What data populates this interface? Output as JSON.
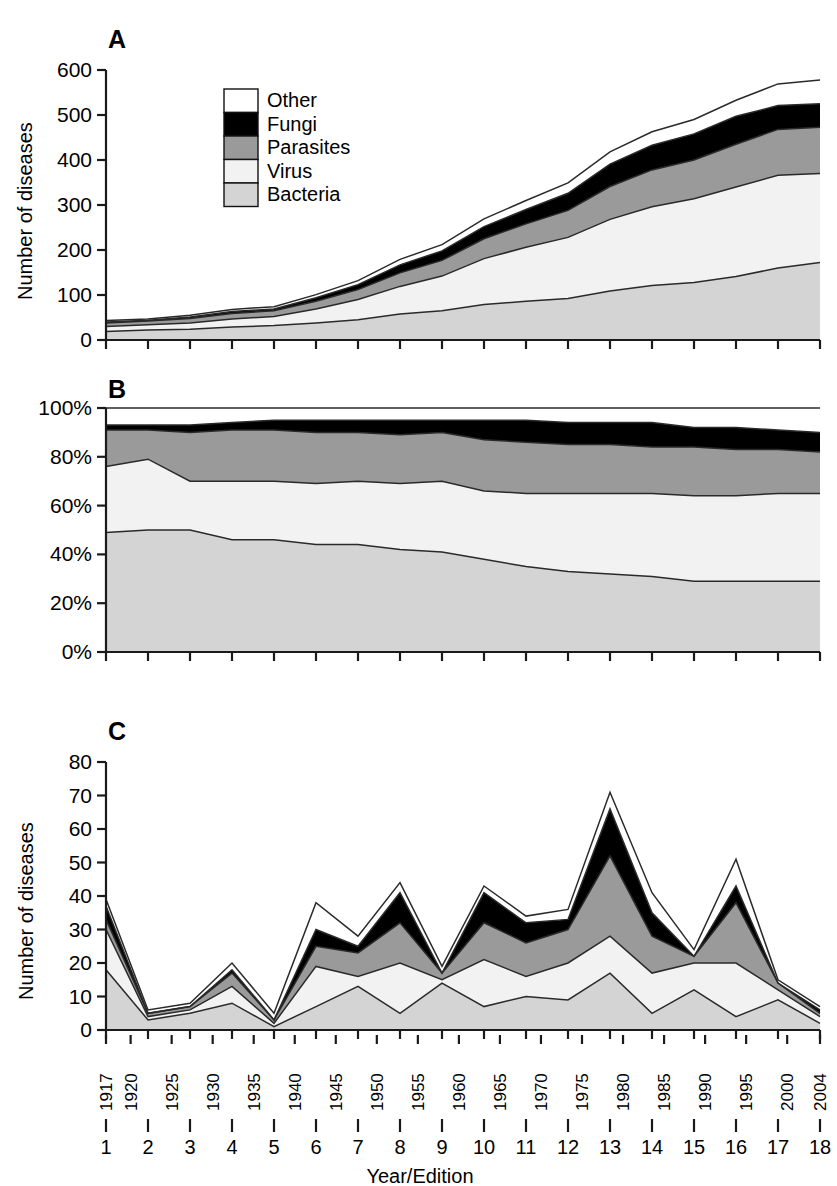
{
  "figure": {
    "panels": [
      {
        "letter": "A",
        "ylabel": "Number of diseases",
        "yticks": [
          "600",
          "500",
          "400",
          "300",
          "200",
          "100",
          "0"
        ]
      },
      {
        "letter": "B",
        "ylabel": "",
        "yticks": [
          "100%",
          "80%",
          "60%",
          "40%",
          "20%",
          "0%"
        ]
      },
      {
        "letter": "C",
        "ylabel": "Number of diseases",
        "yticks": [
          "80",
          "70",
          "60",
          "50",
          "40",
          "30",
          "20",
          "10",
          "0"
        ]
      }
    ],
    "xaxis_title": "Year/Edition",
    "years": [
      "1917",
      "1920",
      "1925",
      "1930",
      "1935",
      "1940",
      "1945",
      "1950",
      "1955",
      "1960",
      "1965",
      "1970",
      "1975",
      "1980",
      "1985",
      "1990",
      "1995",
      "2000",
      "2004"
    ],
    "editions": [
      "1",
      "2",
      "3",
      "4",
      "5",
      "6",
      "7",
      "8",
      "9",
      "10",
      "11",
      "12",
      "13",
      "14",
      "15",
      "16",
      "17",
      "18"
    ],
    "legend": {
      "items": [
        {
          "label": "Other",
          "color": "#ffffff"
        },
        {
          "label": "Fungi",
          "color": "#000000"
        },
        {
          "label": "Parasites",
          "color": "#9a9a9a"
        },
        {
          "label": "Virus",
          "color": "#f2f2f2"
        },
        {
          "label": "Bacteria",
          "color": "#d4d4d4"
        }
      ]
    }
  },
  "chart_data": [
    {
      "type": "area",
      "id": "A",
      "title": "A",
      "xlabel": "Year/Edition",
      "ylabel": "Number of diseases",
      "ylim": [
        0,
        600
      ],
      "yticks": [
        0,
        100,
        200,
        300,
        400,
        500,
        600
      ],
      "grid": false,
      "stacked": true,
      "legend_position": "inside-top-left",
      "categories": [
        "1917",
        "1925",
        "1930",
        "1935",
        "1940",
        "1945",
        "1950",
        "1955",
        "1960",
        "1965",
        "1970",
        "1975",
        "1980",
        "1985",
        "1990",
        "1995",
        "2000",
        "2004"
      ],
      "edition_numbers": [
        1,
        2,
        3,
        4,
        5,
        6,
        7,
        8,
        9,
        10,
        11,
        12,
        13,
        14,
        15,
        16,
        17,
        18
      ],
      "series": [
        {
          "name": "Bacteria",
          "color": "#d4d4d4",
          "values": [
            19,
            22,
            24,
            29,
            32,
            38,
            45,
            58,
            65,
            79,
            86,
            92,
            109,
            121,
            128,
            141,
            160,
            172
          ]
        },
        {
          "name": "Virus",
          "color": "#f2f2f2",
          "values": [
            11,
            12,
            14,
            18,
            20,
            31,
            45,
            61,
            77,
            102,
            120,
            136,
            159,
            175,
            186,
            199,
            206,
            198
          ]
        },
        {
          "name": "Parasites",
          "color": "#9a9a9a",
          "values": [
            8,
            8,
            10,
            12,
            13,
            17,
            22,
            30,
            35,
            44,
            52,
            60,
            73,
            82,
            86,
            95,
            102,
            103
          ]
        },
        {
          "name": "Fungi",
          "color": "#000000",
          "values": [
            2,
            2,
            3,
            4,
            4,
            8,
            11,
            18,
            21,
            27,
            32,
            38,
            50,
            55,
            58,
            62,
            53,
            52
          ]
        },
        {
          "name": "Other",
          "color": "#ffffff",
          "values": [
            3,
            3,
            4,
            5,
            5,
            7,
            9,
            12,
            14,
            17,
            20,
            23,
            27,
            30,
            32,
            36,
            48,
            53
          ]
        }
      ],
      "totals": [
        43,
        47,
        55,
        68,
        74,
        101,
        132,
        179,
        212,
        269,
        310,
        349,
        418,
        463,
        490,
        533,
        569,
        578
      ]
    },
    {
      "type": "area",
      "id": "B",
      "title": "B",
      "xlabel": "Year/Edition",
      "ylabel": "",
      "ylim": [
        0,
        100
      ],
      "yticks": [
        0,
        20,
        40,
        60,
        80,
        100
      ],
      "unit": "%",
      "grid": false,
      "stacked": true,
      "normalized": true,
      "categories": [
        "1917",
        "1925",
        "1930",
        "1935",
        "1940",
        "1945",
        "1950",
        "1955",
        "1960",
        "1965",
        "1970",
        "1975",
        "1980",
        "1985",
        "1990",
        "1995",
        "2000",
        "2004"
      ],
      "edition_numbers": [
        1,
        2,
        3,
        4,
        5,
        6,
        7,
        8,
        9,
        10,
        11,
        12,
        13,
        14,
        15,
        16,
        17,
        18
      ],
      "series": [
        {
          "name": "Bacteria",
          "color": "#d4d4d4",
          "values": [
            49,
            50,
            50,
            46,
            46,
            44,
            44,
            42,
            41,
            38,
            35,
            33,
            32,
            31,
            29,
            29,
            29,
            29
          ]
        },
        {
          "name": "Virus",
          "color": "#f2f2f2",
          "values": [
            27,
            29,
            20,
            24,
            24,
            25,
            26,
            27,
            29,
            28,
            30,
            32,
            33,
            34,
            35,
            35,
            36,
            36
          ]
        },
        {
          "name": "Parasites",
          "color": "#9a9a9a",
          "values": [
            15,
            12,
            20,
            21,
            21,
            21,
            20,
            20,
            20,
            21,
            21,
            20,
            20,
            19,
            20,
            19,
            18,
            17
          ]
        },
        {
          "name": "Fungi",
          "color": "#000000",
          "values": [
            2,
            2,
            3,
            3,
            4,
            5,
            5,
            6,
            5,
            8,
            9,
            9,
            9,
            10,
            8,
            9,
            8,
            8
          ]
        },
        {
          "name": "Other",
          "color": "#ffffff",
          "values": [
            7,
            7,
            7,
            6,
            5,
            5,
            5,
            5,
            5,
            5,
            5,
            6,
            6,
            6,
            8,
            8,
            9,
            10
          ]
        }
      ]
    },
    {
      "type": "area",
      "id": "C",
      "title": "C",
      "xlabel": "Year/Edition",
      "ylabel": "Number of diseases",
      "ylim": [
        0,
        80
      ],
      "yticks": [
        0,
        10,
        20,
        30,
        40,
        50,
        60,
        70,
        80
      ],
      "grid": false,
      "stacked": true,
      "categories": [
        "1917",
        "1925",
        "1930",
        "1935",
        "1940",
        "1945",
        "1950",
        "1955",
        "1960",
        "1965",
        "1970",
        "1975",
        "1980",
        "1985",
        "1990",
        "1995",
        "2000",
        "2004"
      ],
      "edition_numbers": [
        1,
        2,
        3,
        4,
        5,
        6,
        7,
        8,
        9,
        10,
        11,
        12,
        13,
        14,
        15,
        16,
        17,
        18
      ],
      "series": [
        {
          "name": "Bacteria",
          "color": "#d4d4d4",
          "values": [
            18,
            3,
            5,
            8,
            1,
            7,
            13,
            5,
            14,
            7,
            10,
            9,
            17,
            5,
            12,
            4,
            9,
            2
          ]
        },
        {
          "name": "Virus",
          "color": "#f2f2f2",
          "values": [
            12,
            1,
            1,
            5,
            1,
            12,
            3,
            15,
            1,
            14,
            6,
            11,
            11,
            12,
            8,
            16,
            3,
            2
          ]
        },
        {
          "name": "Parasites",
          "color": "#9a9a9a",
          "values": [
            3,
            1,
            1,
            4,
            1,
            6,
            7,
            12,
            2,
            11,
            10,
            10,
            24,
            11,
            2,
            18,
            2,
            1
          ]
        },
        {
          "name": "Fungi",
          "color": "#000000",
          "values": [
            4,
            0,
            0,
            1,
            0,
            5,
            2,
            9,
            0,
            9,
            6,
            3,
            14,
            7,
            0,
            5,
            0,
            1
          ]
        },
        {
          "name": "Other",
          "color": "#ffffff",
          "values": [
            2,
            1,
            1,
            2,
            2,
            8,
            3,
            3,
            2,
            2,
            2,
            3,
            5,
            6,
            2,
            8,
            1,
            1
          ]
        }
      ],
      "totals": [
        39,
        6,
        8,
        20,
        5,
        38,
        28,
        44,
        19,
        43,
        34,
        36,
        71,
        41,
        24,
        51,
        15,
        7
      ]
    }
  ]
}
